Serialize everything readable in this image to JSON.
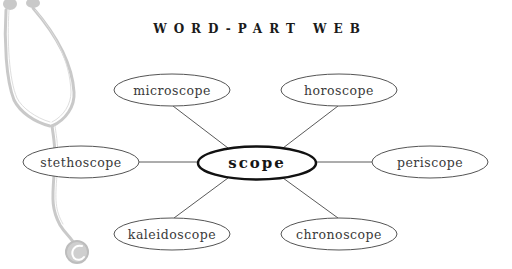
{
  "title": "WORD-PART WEB",
  "diagram": {
    "type": "word-web",
    "center": {
      "label": "scope",
      "cx": 257,
      "cy": 163,
      "rx": 59,
      "ry": 17
    },
    "nodes": [
      {
        "id": "microscope",
        "label": "microscope",
        "cx": 172,
        "cy": 90,
        "rx": 58,
        "ry": 16
      },
      {
        "id": "horoscope",
        "label": "horoscope",
        "cx": 339,
        "cy": 90,
        "rx": 58,
        "ry": 16
      },
      {
        "id": "stethoscope",
        "label": "stethoscope",
        "cx": 81,
        "cy": 162,
        "rx": 58,
        "ry": 16
      },
      {
        "id": "periscope",
        "label": "periscope",
        "cx": 430,
        "cy": 162,
        "rx": 58,
        "ry": 16
      },
      {
        "id": "kaleidoscope",
        "label": "kaleidoscope",
        "cx": 172,
        "cy": 234,
        "rx": 58,
        "ry": 16
      },
      {
        "id": "chronoscope",
        "label": "chronoscope",
        "cx": 339,
        "cy": 234,
        "rx": 58,
        "ry": 16
      }
    ],
    "edges": [
      {
        "from": "scope",
        "to": "microscope",
        "x1": 228,
        "y1": 148,
        "x2": 173,
        "y2": 106
      },
      {
        "from": "scope",
        "to": "horoscope",
        "x1": 283,
        "y1": 148,
        "x2": 338,
        "y2": 106
      },
      {
        "from": "scope",
        "to": "stethoscope",
        "x1": 198,
        "y1": 162,
        "x2": 139,
        "y2": 162
      },
      {
        "from": "scope",
        "to": "periscope",
        "x1": 316,
        "y1": 162,
        "x2": 372,
        "y2": 162
      },
      {
        "from": "scope",
        "to": "kaleidoscope",
        "x1": 228,
        "y1": 178,
        "x2": 174,
        "y2": 218
      },
      {
        "from": "scope",
        "to": "chronoscope",
        "x1": 283,
        "y1": 178,
        "x2": 338,
        "y2": 218
      }
    ]
  },
  "illustration": {
    "name": "stethoscope",
    "color": "#c8c8c8"
  },
  "colors": {
    "node_stroke": "#555555",
    "center_stroke": "#111111",
    "edge": "#555555",
    "text": "#3a3a3a"
  }
}
